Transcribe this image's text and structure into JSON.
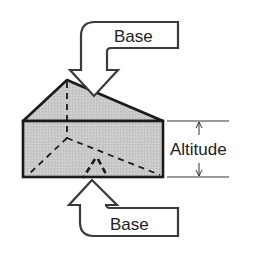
{
  "diagram": {
    "labels": {
      "top_base": "Base",
      "bottom_base": "Base",
      "altitude": "Altitude"
    },
    "colors": {
      "face_fill": "#c8c8c8",
      "stroke": "#1a1a1a",
      "arrow_fill": "#ffffff",
      "arrow_stroke": "#3a3a3a",
      "text": "#222222"
    }
  }
}
